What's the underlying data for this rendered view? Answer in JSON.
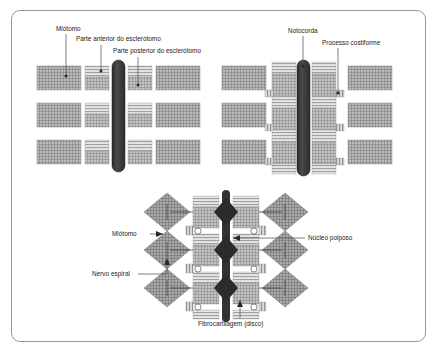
{
  "figure": {
    "domain": "scientific-illustration",
    "border_color": "#9a9a9a",
    "background_color": "#ffffff",
    "text_color": "#1a1a1a",
    "leader_line_color": "#555555",
    "notochord_color": "#3b3b3b",
    "block_outline_color": "#8c8c8c",
    "myotome_fill": "#8f8f8f",
    "sclerotome_anterior_fill": "#d2d2d2",
    "sclerotome_posterior_fill": "#9c9c9c"
  },
  "panels": {
    "top_left": {
      "name": "Estagio pre-resegmentacao",
      "labels": [
        {
          "id": "miotomo",
          "text": "Miótomo"
        },
        {
          "id": "parte-anterior",
          "text": "Parte anterior do esclerótomo"
        },
        {
          "id": "parte-posterior",
          "text": "Parte posterior do esclerótomo"
        }
      ]
    },
    "top_right": {
      "name": "Estagio pos-resegmentacao",
      "labels": [
        {
          "id": "notocorda",
          "text": "Notocorda"
        },
        {
          "id": "processo-costiforme",
          "text": "Processo costiforme"
        }
      ]
    },
    "bottom": {
      "name": "Vertebra definitiva com disco intervertebral",
      "labels": [
        {
          "id": "miotomo-b",
          "text": "Miótomo"
        },
        {
          "id": "nervo-espiral",
          "text": "Nervo espiral"
        },
        {
          "id": "nucleo-polposo",
          "text": "Núcleo polposo"
        },
        {
          "id": "fibrocartilagem",
          "text": "Fibrocartilagem (disco)"
        }
      ]
    }
  },
  "label_text": {
    "miotomo": "Miótomo",
    "parte_anterior": "Parte anterior do esclerótomo",
    "parte_posterior": "Parte posterior do esclerótomo",
    "notocorda": "Notocorda",
    "processo_costiforme": "Processo costiforme",
    "miotomo_bottom": "Miótomo",
    "nervo_espiral": "Nervo espiral",
    "nucleo_polposo": "Núcleo polposo",
    "fibrocartilagem": "Fibrocartilagem (disco)"
  }
}
